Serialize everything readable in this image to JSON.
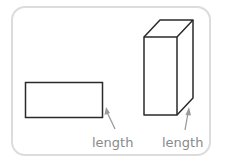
{
  "diagram": {
    "shapes": [
      {
        "name": "rectangle",
        "label": "length"
      },
      {
        "name": "rectangular-prism",
        "label": "length"
      }
    ],
    "colors": {
      "outline": "#2a2a2a",
      "arrow": "#9a9a9a",
      "label": "#8a8a8a",
      "frame": "#dcdcdc"
    }
  }
}
